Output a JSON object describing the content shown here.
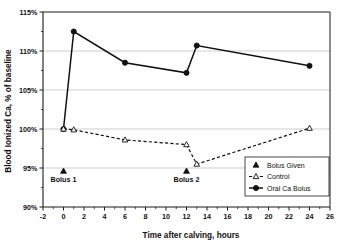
{
  "chart_data": {
    "type": "line",
    "title": "",
    "xlabel": "Time after calving, hours",
    "ylabel": "Blood Ionized Ca, % of baseline",
    "xlim": [
      -2,
      26
    ],
    "ylim": [
      90,
      115
    ],
    "xticks": [
      -2,
      0,
      2,
      4,
      6,
      8,
      10,
      12,
      14,
      16,
      18,
      20,
      22,
      24,
      26
    ],
    "xticklabels": [
      "-2",
      "0",
      "2",
      "4",
      "6",
      "8",
      "10",
      "12",
      "14",
      "16",
      "18",
      "20",
      "22",
      "24",
      "26"
    ],
    "x_minor_tick_step": 1,
    "yticks": [
      90,
      95,
      100,
      105,
      110,
      115
    ],
    "yticklabels": [
      "90%",
      "95%",
      "100%",
      "105%",
      "110%",
      "115%"
    ],
    "grid": "horizontal",
    "legend_position": "lower-right",
    "series": [
      {
        "name": "Oral Ca Bolus",
        "style": "solid",
        "marker": "filled-circle",
        "color": "#111111",
        "x": [
          0,
          1,
          6,
          12,
          13,
          24
        ],
        "values": [
          100.0,
          112.5,
          108.5,
          107.2,
          110.7,
          108.1
        ]
      },
      {
        "name": "Control",
        "style": "dashed",
        "marker": "open-triangle",
        "color": "#111111",
        "x": [
          0,
          1,
          6,
          12,
          13,
          24
        ],
        "values": [
          100.0,
          99.9,
          98.6,
          98.0,
          95.5,
          100.1
        ]
      },
      {
        "name": "Bolus Given",
        "style": "none",
        "marker": "filled-triangle",
        "color": "#111111",
        "x": [
          0,
          12
        ],
        "values": [
          94.6,
          94.6
        ]
      }
    ],
    "annotations": [
      {
        "text": "Bolus 1",
        "x": 0,
        "y": 93.2
      },
      {
        "text": "Bolus 2",
        "x": 12,
        "y": 93.2
      }
    ],
    "legend_entries": [
      {
        "label": "Bolus Given",
        "marker": "filled-triangle",
        "line": "none"
      },
      {
        "label": "Control",
        "marker": "open-triangle",
        "line": "dashed"
      },
      {
        "label": "Oral Ca Bolus",
        "marker": "filled-circle",
        "line": "solid"
      }
    ]
  }
}
